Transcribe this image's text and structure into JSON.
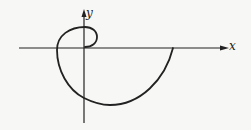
{
  "diagram": {
    "type": "spiral-curve-plot",
    "axes": {
      "x_label": "x",
      "y_label": "y",
      "origin": [
        84,
        48
      ]
    },
    "colors": {
      "stroke": "#222222",
      "background": "#f7f7f5"
    },
    "curve": {
      "description": "Spiral starting at origin, looping counterclockwise around origin and expanding, ending on the positive x-axis",
      "path": "M 85 47 C 92 47, 97 43, 97 37 C 97 31, 92 27, 85 27 C 70 27, 57 35, 57 50 C 57 70, 68 90, 84 98 C 92 102, 100 105, 110 105 C 140 105, 165 80, 173 48"
    }
  }
}
